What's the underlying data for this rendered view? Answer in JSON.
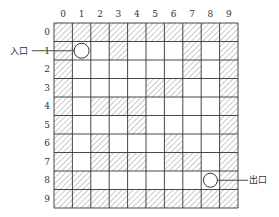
{
  "diagram": {
    "type": "maze-grid",
    "rows": 10,
    "cols": 10,
    "col_labels": [
      "0",
      "1",
      "2",
      "3",
      "4",
      "5",
      "6",
      "7",
      "8",
      "9"
    ],
    "row_labels": [
      "0",
      "1",
      "2",
      "3",
      "4",
      "5",
      "6",
      "7",
      "8",
      "9"
    ],
    "walls": [
      [
        1,
        1,
        1,
        1,
        1,
        1,
        1,
        1,
        1,
        1
      ],
      [
        1,
        0,
        0,
        1,
        0,
        0,
        0,
        1,
        0,
        1
      ],
      [
        1,
        0,
        0,
        0,
        0,
        0,
        0,
        1,
        0,
        1
      ],
      [
        1,
        0,
        0,
        0,
        0,
        1,
        1,
        0,
        0,
        1
      ],
      [
        1,
        0,
        1,
        1,
        1,
        0,
        0,
        0,
        0,
        1
      ],
      [
        1,
        0,
        0,
        0,
        1,
        0,
        0,
        0,
        0,
        1
      ],
      [
        1,
        0,
        1,
        0,
        0,
        0,
        1,
        0,
        0,
        1
      ],
      [
        1,
        0,
        1,
        1,
        1,
        0,
        1,
        1,
        0,
        1
      ],
      [
        1,
        1,
        0,
        0,
        0,
        0,
        0,
        0,
        0,
        1
      ],
      [
        1,
        1,
        1,
        1,
        1,
        1,
        1,
        1,
        1,
        1
      ]
    ],
    "entrance": {
      "label": "入口",
      "row": 1,
      "col": 1
    },
    "exit": {
      "label": "出口",
      "row": 8,
      "col": 8
    },
    "colors": {
      "line": "#333333",
      "hatch": "#666666",
      "background": "#ffffff"
    }
  }
}
